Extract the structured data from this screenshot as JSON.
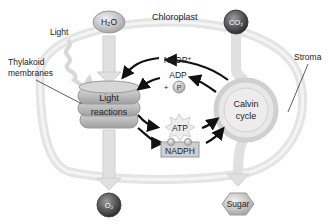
{
  "title": "Chloroplast",
  "labels": {
    "light": "Light",
    "thylakoid_line1": "Thylakoid",
    "thylakoid_line2": "membranes",
    "stroma": "Stroma"
  },
  "molecules": {
    "h2o": "H₂O",
    "co2": "CO₂",
    "o2": "O₂",
    "sugar": "Sugar",
    "nadp": "NADP⁺",
    "adp": "ADP",
    "plus": "+",
    "p": "P",
    "atp": "ATP",
    "nadph": "NADPH"
  },
  "processes": {
    "light_reactions_line1": "Light",
    "light_reactions_line2": "reactions",
    "calvin_line1": "Calvin",
    "calvin_line2": "cycle"
  },
  "colors": {
    "membrane": "#e6e6e6",
    "thylakoid": "#bdbdbd",
    "arrow": "#111111",
    "sphere_dark": "#555555",
    "sphere_light": "#cfcfcf"
  }
}
